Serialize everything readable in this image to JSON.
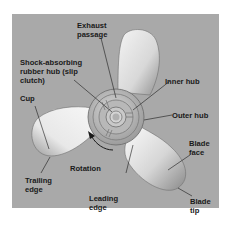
{
  "diagram": {
    "background_color": "#a9a9a9",
    "labels": {
      "exhaust_passage": "Exhaust\npassage",
      "shock_absorbing_hub": "Shock-absorbing\nrubber hub (slip\nclutch)",
      "inner_hub": "Inner hub",
      "outer_hub": "Outer hub",
      "cup": "Cup",
      "trailing_edge": "Trailing\nedge",
      "rotation": "Rotation",
      "leading_edge": "Leading\nedge",
      "blade_face": "Blade\nface",
      "blade_tip": "Blade\ntip"
    }
  }
}
